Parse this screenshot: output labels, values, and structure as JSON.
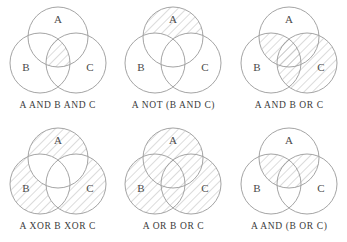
{
  "page": {
    "background_color": "#ffffff",
    "stroke_color": "#9a9a9a",
    "hatch_color": "#b9b9b9",
    "text_color": "#3b3b3b",
    "rows": 2,
    "columns": 3
  },
  "set_labels": {
    "a": "A",
    "b": "B",
    "c": "C"
  },
  "diagrams": [
    {
      "id": "a-and-b-and-c",
      "caption": "A AND B AND C",
      "labels": {
        "a": "A",
        "b": "B",
        "c": "C"
      },
      "shaded_regions": [
        "A∩B∩C"
      ]
    },
    {
      "id": "a-not-b-and-c",
      "caption": "A NOT (B AND C)",
      "labels": {
        "a": "A",
        "b": "B",
        "c": "C"
      },
      "shaded_regions": [
        "A only"
      ]
    },
    {
      "id": "a-and-b-or-c",
      "caption": "A AND B OR C",
      "labels": {
        "a": "A",
        "b": "B",
        "c": "C"
      },
      "shaded_regions": [
        "A∩B",
        "C"
      ]
    },
    {
      "id": "a-xor-b-xor-c",
      "caption": "A XOR B XOR C",
      "labels": {
        "a": "A",
        "b": "B",
        "c": "C"
      },
      "shaded_regions": [
        "A only",
        "B only",
        "C only"
      ]
    },
    {
      "id": "a-or-b-or-c",
      "caption": "A OR B OR C",
      "labels": {
        "a": "A",
        "b": "B",
        "c": "C"
      },
      "shaded_regions": [
        "A",
        "B",
        "C"
      ]
    },
    {
      "id": "a-and-b-or-c-parens",
      "caption": "A AND (B OR C)",
      "labels": {
        "a": "A",
        "b": "B",
        "c": "C"
      },
      "shaded_regions": [
        "A∩B",
        "A∩C",
        "A∩B∩C"
      ]
    }
  ]
}
